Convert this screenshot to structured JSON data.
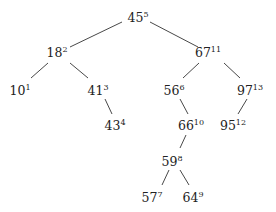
{
  "diagram": {
    "type": "binary-search-tree",
    "colors": {
      "edge": "#333333",
      "text": "#222222",
      "background": "#ffffff"
    },
    "nodes": [
      {
        "id": "n45",
        "key": "45",
        "rank": "5",
        "x": 138,
        "y": 22
      },
      {
        "id": "n18",
        "key": "18",
        "rank": "2",
        "x": 57,
        "y": 57
      },
      {
        "id": "n67",
        "key": "67",
        "rank": "11",
        "x": 208,
        "y": 57
      },
      {
        "id": "n10",
        "key": "10",
        "rank": "1",
        "x": 20,
        "y": 95
      },
      {
        "id": "n41",
        "key": "41",
        "rank": "3",
        "x": 98,
        "y": 95
      },
      {
        "id": "n56",
        "key": "56",
        "rank": "6",
        "x": 174,
        "y": 95
      },
      {
        "id": "n97",
        "key": "97",
        "rank": "13",
        "x": 250,
        "y": 95
      },
      {
        "id": "n43",
        "key": "43",
        "rank": "4",
        "x": 115,
        "y": 130
      },
      {
        "id": "n66",
        "key": "66",
        "rank": "10",
        "x": 191,
        "y": 130
      },
      {
        "id": "n95",
        "key": "95",
        "rank": "12",
        "x": 233,
        "y": 130
      },
      {
        "id": "n59",
        "key": "59",
        "rank": "8",
        "x": 172,
        "y": 166
      },
      {
        "id": "n57",
        "key": "57",
        "rank": "7",
        "x": 152,
        "y": 202
      },
      {
        "id": "n64",
        "key": "64",
        "rank": "9",
        "x": 193,
        "y": 202
      }
    ],
    "edges": [
      {
        "from": "n45",
        "to": "n18",
        "x1": 122,
        "y1": 22,
        "x2": 70,
        "y2": 47
      },
      {
        "from": "n45",
        "to": "n67",
        "x1": 150,
        "y1": 22,
        "x2": 198,
        "y2": 47
      },
      {
        "from": "n18",
        "to": "n10",
        "x1": 48,
        "y1": 63,
        "x2": 31,
        "y2": 78
      },
      {
        "from": "n18",
        "to": "n41",
        "x1": 70,
        "y1": 63,
        "x2": 88,
        "y2": 78
      },
      {
        "from": "n67",
        "to": "n56",
        "x1": 199,
        "y1": 63,
        "x2": 183,
        "y2": 78
      },
      {
        "from": "n67",
        "to": "n97",
        "x1": 224,
        "y1": 63,
        "x2": 240,
        "y2": 78
      },
      {
        "from": "n41",
        "to": "n43",
        "x1": 105,
        "y1": 99,
        "x2": 112,
        "y2": 114
      },
      {
        "from": "n56",
        "to": "n66",
        "x1": 180,
        "y1": 99,
        "x2": 188,
        "y2": 114
      },
      {
        "from": "n97",
        "to": "n95",
        "x1": 247,
        "y1": 99,
        "x2": 238,
        "y2": 114
      },
      {
        "from": "n66",
        "to": "n59",
        "x1": 186,
        "y1": 135,
        "x2": 180,
        "y2": 148
      },
      {
        "from": "n59",
        "to": "n57",
        "x1": 169,
        "y1": 170,
        "x2": 162,
        "y2": 185
      },
      {
        "from": "n59",
        "to": "n64",
        "x1": 180,
        "y1": 170,
        "x2": 189,
        "y2": 185
      }
    ]
  }
}
